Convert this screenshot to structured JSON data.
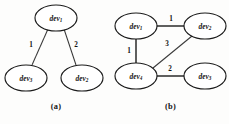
{
  "figure": {
    "panels": [
      {
        "id": "a",
        "caption": "(a)",
        "nodes": [
          {
            "id": "n1",
            "base": "dev",
            "sub": "1",
            "cx": 56,
            "cy": 18,
            "rx": 21,
            "ry": 13
          },
          {
            "id": "n2",
            "base": "dev",
            "sub": "3",
            "cx": 26,
            "cy": 78,
            "rx": 21,
            "ry": 13
          },
          {
            "id": "n3",
            "base": "dev",
            "sub": "2",
            "cx": 82,
            "cy": 78,
            "rx": 21,
            "ry": 13
          }
        ],
        "edges": [
          {
            "from": "n1",
            "to": "n2",
            "weight": "1",
            "x1": 48,
            "y1": 29,
            "x2": 32,
            "y2": 65,
            "lx": 31,
            "ly": 45
          },
          {
            "from": "n1",
            "to": "n3",
            "weight": "2",
            "x1": 64,
            "y1": 29,
            "x2": 76,
            "y2": 65,
            "lx": 76,
            "ly": 45
          }
        ]
      },
      {
        "id": "b",
        "caption": "(b)",
        "nodes": [
          {
            "id": "m1",
            "base": "dev",
            "sub": "1",
            "cx": 24,
            "cy": 26,
            "rx": 21,
            "ry": 13
          },
          {
            "id": "m2",
            "base": "dev",
            "sub": "2",
            "cx": 93,
            "cy": 26,
            "rx": 21,
            "ry": 13
          },
          {
            "id": "m3",
            "base": "dev",
            "sub": "4",
            "cx": 24,
            "cy": 76,
            "rx": 21,
            "ry": 13
          },
          {
            "id": "m4",
            "base": "dev",
            "sub": "3",
            "cx": 93,
            "cy": 76,
            "rx": 21,
            "ry": 13
          }
        ],
        "edges": [
          {
            "from": "m1",
            "to": "m2",
            "weight": "1",
            "x1": 45,
            "y1": 26,
            "x2": 72,
            "y2": 26,
            "lx": 59,
            "ly": 19
          },
          {
            "from": "m1",
            "to": "m3",
            "weight": "1",
            "x1": 24,
            "y1": 39,
            "x2": 24,
            "y2": 63,
            "lx": 17,
            "ly": 51
          },
          {
            "from": "m3",
            "to": "m2",
            "weight": "3",
            "x1": 41,
            "y1": 68,
            "x2": 80,
            "y2": 36,
            "lx": 55,
            "ly": 44
          },
          {
            "from": "m3",
            "to": "m4",
            "weight": "2",
            "x1": 45,
            "y1": 76,
            "x2": 72,
            "y2": 76,
            "lx": 58,
            "ly": 69
          }
        ]
      }
    ]
  }
}
